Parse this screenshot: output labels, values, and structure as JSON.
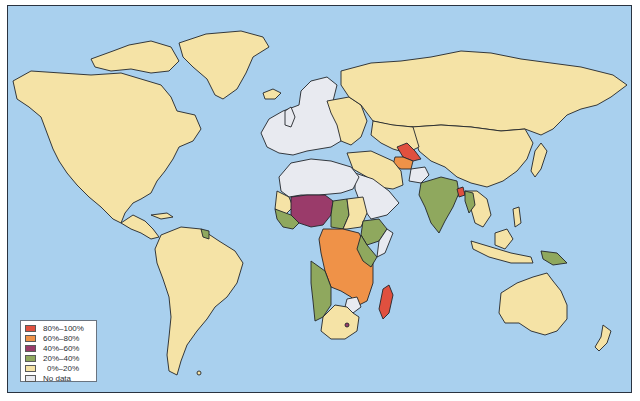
{
  "map": {
    "type": "choropleth-world-map",
    "ocean_color": "#a9d0ee",
    "border_color": "#23262a"
  },
  "legend": {
    "items": [
      {
        "label": "80%–100%",
        "color": "#e0503f"
      },
      {
        "label": "60%–80%",
        "color": "#ef9248"
      },
      {
        "label": "40%–60%",
        "color": "#9a3b6a"
      },
      {
        "label": "20%–40%",
        "color": "#8fa85e"
      },
      {
        "label": "0%–20%",
        "color": "#f5e3a6"
      },
      {
        "label": "No data",
        "color": "#e8eaf0"
      }
    ]
  },
  "regions": {
    "80-100": [
      "Turkmenistan/Uzbekistan region",
      "Bangladesh",
      "Madagascar"
    ],
    "60-80": [
      "Central Asia (Turkmenistan)",
      "Central Africa (DR Congo, Angola, Zambia, Mozambique, Tanzania)"
    ],
    "40-60": [
      "West Africa (Mali, Burkina Faso, Niger, Nigeria)"
    ],
    "20-40": [
      "India",
      "Ethiopia",
      "Kenya",
      "Chad",
      "Sahel/West Africa coast",
      "Namibia",
      "Botswana",
      "Myanmar",
      "Papua New Guinea"
    ],
    "0-20": [
      "North America",
      "South America",
      "Russia",
      "China",
      "Australia",
      "Greenland",
      "Middle East",
      "Southern Africa",
      "Sudan"
    ],
    "no-data": [
      "Western Europe",
      "North Africa",
      "Saudi Arabia",
      "Afghanistan",
      "Zimbabwe"
    ]
  }
}
